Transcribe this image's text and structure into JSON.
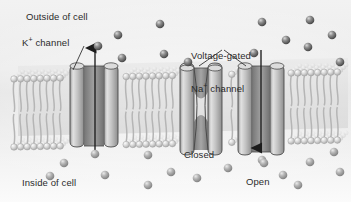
{
  "figure": {
    "type": "biology-diagram",
    "width": 351,
    "height": 202,
    "background_color": "#eeeeee"
  },
  "labels": {
    "outside": "Outside of cell",
    "inside": "Inside of cell",
    "k_channel": "K",
    "k_channel_sup": "+",
    "k_channel_tail": " channel",
    "na_channel_line1": "Voltage-gated",
    "na_channel_line2a": "Na",
    "na_channel_sup": "+",
    "na_channel_line2b": " channel",
    "closed": "Closed",
    "open": "Open"
  },
  "colors": {
    "ion": "#5d5d5d",
    "ion_highlight": "#c9c9c9",
    "channel_fill": "#b9b9b9",
    "channel_dark": "#8a8a8a",
    "channel_stroke": "#4a4a4a",
    "lipid_head": "#cfcfcf",
    "lipid_tail": "#b5b5b5",
    "text": "#2b2b2b",
    "arrow": "#1c1c1c"
  },
  "membrane": {
    "top_y": 72,
    "bottom_y": 140,
    "left_x": 14,
    "right_x": 341,
    "description": "phospholipid bilayer drawn in 3-D perspective"
  },
  "channels": [
    {
      "name": "k-channel",
      "label_ref": "k_channel",
      "state": "open",
      "x": 86,
      "ion_flow": "outward"
    },
    {
      "name": "na-channel-closed",
      "label_ref": "closed",
      "state": "closed",
      "x": 196,
      "ion_flow": "none"
    },
    {
      "name": "na-channel-open",
      "label_ref": "open",
      "state": "open",
      "x": 254,
      "ion_flow": "inward"
    }
  ],
  "arrows": [
    {
      "name": "k-efflux-arrow",
      "direction": "up",
      "from_y": 152,
      "to_y": 46,
      "x": 95
    },
    {
      "name": "na-influx-arrow",
      "direction": "down",
      "from_y": 52,
      "to_y": 150,
      "x": 261
    }
  ],
  "ions_outside": [
    [
      118,
      35
    ],
    [
      98,
      46
    ],
    [
      160,
      24
    ],
    [
      122,
      58
    ],
    [
      164,
      54
    ],
    [
      254,
      53
    ],
    [
      286,
      40
    ],
    [
      308,
      47
    ],
    [
      262,
      22
    ],
    [
      310,
      20
    ],
    [
      332,
      35
    ],
    [
      188,
      62
    ],
    [
      340,
      62
    ]
  ],
  "ions_inside": [
    [
      95,
      154
    ],
    [
      64,
      163
    ],
    [
      148,
      155
    ],
    [
      105,
      175
    ],
    [
      171,
      172
    ],
    [
      197,
      178
    ],
    [
      148,
      185
    ],
    [
      228,
      168
    ],
    [
      262,
      160
    ],
    [
      264,
      163
    ],
    [
      283,
      175
    ],
    [
      310,
      162
    ],
    [
      298,
      185
    ],
    [
      334,
      152
    ],
    [
      340,
      172
    ],
    [
      50,
      176
    ]
  ]
}
